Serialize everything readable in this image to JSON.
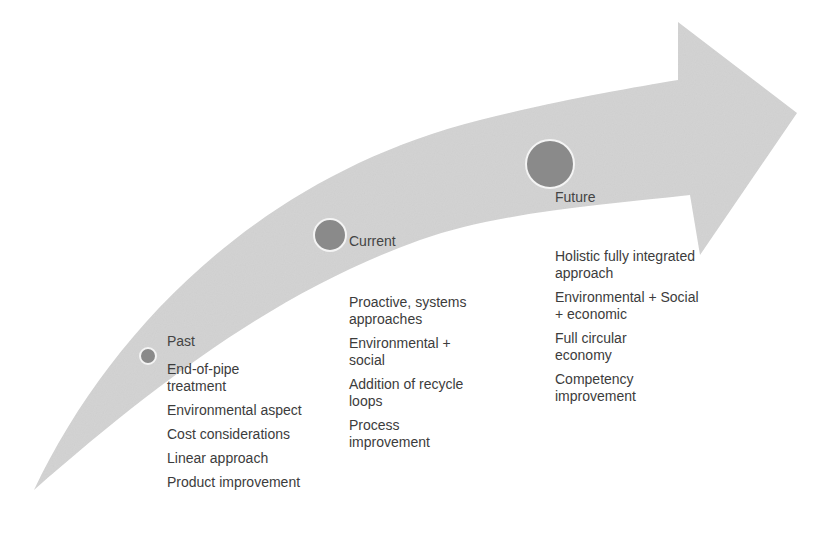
{
  "diagram": {
    "type": "curved-arrow-timeline",
    "arrow_color": "#d4d4d4",
    "node_color": "#8a8a8a",
    "stages": [
      {
        "label": "Past",
        "items": [
          "End-of-pipe treatment",
          "Environmental aspect",
          "Cost considerations",
          "Linear approach",
          "Product improvement"
        ]
      },
      {
        "label": "Current",
        "items": [
          "Proactive, systems approaches",
          "Environmental + social",
          "Addition of recycle loops",
          "Process improvement"
        ]
      },
      {
        "label": "Future",
        "items": [
          "Holistic fully integrated approach",
          "Environmental + Social + economic",
          "Full circular economy",
          "Competency improvement"
        ]
      }
    ]
  }
}
